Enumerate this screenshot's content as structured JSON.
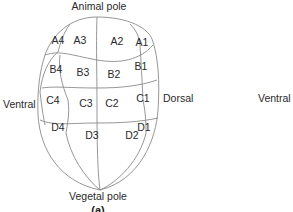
{
  "diagram": {
    "labels": {
      "animal_pole": "Animal pole",
      "vegetal_pole": "Vegetal pole",
      "left_side": "Ventral",
      "right_side": "Dorsal",
      "far_right": "Ventral",
      "panel": "(a)"
    },
    "tiers": {
      "A": [
        "A1",
        "A2",
        "A3",
        "A4"
      ],
      "B": [
        "B1",
        "B2",
        "B3",
        "B4"
      ],
      "C": [
        "C1",
        "C2",
        "C3",
        "C4"
      ],
      "D": [
        "D1",
        "D2",
        "D3",
        "D4"
      ]
    },
    "colors": {
      "outline": "#8a8a8a",
      "text": "#2a2a2a",
      "background": "#ffffff"
    }
  }
}
